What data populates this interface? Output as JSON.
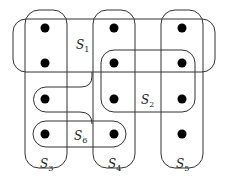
{
  "diagram": {
    "type": "set-cover",
    "stroke_color": "#333333",
    "point_color": "#000000",
    "points": [
      {
        "id": "p11",
        "x": 45,
        "y": 28
      },
      {
        "id": "p12",
        "x": 114,
        "y": 28
      },
      {
        "id": "p13",
        "x": 182,
        "y": 28
      },
      {
        "id": "p21",
        "x": 45,
        "y": 63
      },
      {
        "id": "p22",
        "x": 114,
        "y": 63
      },
      {
        "id": "p23",
        "x": 182,
        "y": 63
      },
      {
        "id": "p31",
        "x": 45,
        "y": 99
      },
      {
        "id": "p32",
        "x": 114,
        "y": 99
      },
      {
        "id": "p33",
        "x": 182,
        "y": 99
      },
      {
        "id": "p41",
        "x": 45,
        "y": 134
      },
      {
        "id": "p42",
        "x": 114,
        "y": 134
      },
      {
        "id": "p43",
        "x": 182,
        "y": 134
      }
    ],
    "sets": [
      {
        "name": "S",
        "sub": "1",
        "label_x": 76,
        "label_y": 49,
        "members": [
          "p11",
          "p12",
          "p13",
          "p21",
          "p22",
          "p23",
          "p31"
        ]
      },
      {
        "name": "S",
        "sub": "2",
        "label_x": 141,
        "label_y": 104,
        "members": [
          "p22",
          "p23",
          "p32",
          "p33"
        ]
      },
      {
        "name": "S",
        "sub": "3",
        "label_x": 40,
        "label_y": 168,
        "members": [
          "p11",
          "p21",
          "p31",
          "p41"
        ]
      },
      {
        "name": "S",
        "sub": "4",
        "label_x": 108,
        "label_y": 168,
        "members": [
          "p12",
          "p22",
          "p32",
          "p42"
        ]
      },
      {
        "name": "S",
        "sub": "5",
        "label_x": 176,
        "label_y": 168,
        "members": [
          "p13",
          "p23",
          "p33",
          "p43"
        ]
      },
      {
        "name": "S",
        "sub": "6",
        "label_x": 74,
        "label_y": 140,
        "members": [
          "p41",
          "p42"
        ]
      }
    ]
  }
}
